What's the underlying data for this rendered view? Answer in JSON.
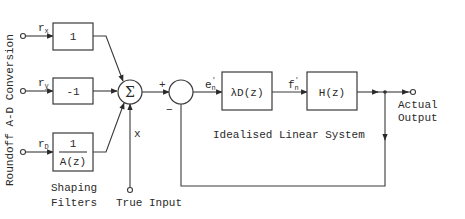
{
  "diagram": {
    "side_label": "Roundoff  A-D Conversion",
    "inputs": [
      {
        "symbol": "r",
        "subscript": "x"
      },
      {
        "symbol": "r",
        "subscript": "y"
      },
      {
        "symbol": "r",
        "subscript": "D"
      }
    ],
    "shaping_filters": {
      "box1": "1",
      "box2": "-1",
      "box3_numerator": "1",
      "box3_denominator": "A(z)",
      "caption_line1": "Shaping",
      "caption_line2": "Filters"
    },
    "summing_junction": {
      "symbol": "Σ",
      "input_label": "x"
    },
    "true_input": "True Input",
    "comparator": {
      "plus": "+",
      "minus": "−"
    },
    "error_signal": {
      "symbol": "e",
      "subscript": "n",
      "prime": "'"
    },
    "controller": "λD(z)",
    "controller_output": {
      "symbol": "f",
      "subscript": "n",
      "prime": "'"
    },
    "plant": "H(z)",
    "output_line1": "Actual",
    "output_line2": "Output",
    "system_caption": "Idealised Linear System"
  }
}
